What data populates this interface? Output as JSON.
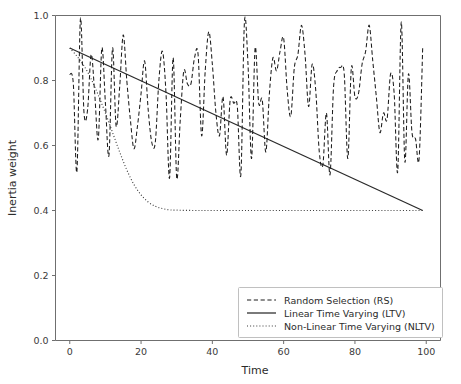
{
  "chart_data": {
    "type": "line",
    "title": "",
    "xlabel": "Time",
    "ylabel": "Inertia weight",
    "xlim": [
      -4,
      104
    ],
    "ylim": [
      0.0,
      1.0
    ],
    "xticks": [
      0,
      20,
      40,
      60,
      80,
      100
    ],
    "xtick_labels": [
      "0",
      "20",
      "40",
      "60",
      "80",
      "100"
    ],
    "yticks": [
      0.0,
      0.2,
      0.4,
      0.6,
      0.8,
      1.0
    ],
    "ytick_labels": [
      "0.0",
      "0.2",
      "0.4",
      "0.6",
      "0.8",
      "1.0"
    ],
    "grid": false,
    "legend_position": "lower right",
    "series": [
      {
        "name": "Random Selection (RS)",
        "style": "dashed",
        "color": "#1c1c1c",
        "x": [
          0,
          1,
          2,
          3,
          4,
          5,
          6,
          7,
          8,
          9,
          10,
          11,
          12,
          13,
          14,
          15,
          16,
          17,
          18,
          19,
          20,
          21,
          22,
          23,
          24,
          25,
          26,
          27,
          28,
          29,
          30,
          31,
          32,
          33,
          34,
          35,
          36,
          37,
          38,
          39,
          40,
          41,
          42,
          43,
          44,
          45,
          46,
          47,
          48,
          49,
          50,
          51,
          52,
          53,
          54,
          55,
          56,
          57,
          58,
          59,
          60,
          61,
          62,
          63,
          64,
          65,
          66,
          67,
          68,
          69,
          70,
          71,
          72,
          73,
          74,
          75,
          76,
          77,
          78,
          79,
          80,
          81,
          82,
          83,
          84,
          85,
          86,
          87,
          88,
          89,
          90,
          91,
          92,
          93,
          94,
          95,
          96,
          97,
          98,
          99
        ],
        "values": [
          0.82,
          0.79,
          0.52,
          0.99,
          0.7,
          0.71,
          0.88,
          0.76,
          0.62,
          0.9,
          0.73,
          0.57,
          0.9,
          0.66,
          0.78,
          0.94,
          0.8,
          0.68,
          0.59,
          0.66,
          0.76,
          0.86,
          0.71,
          0.61,
          0.61,
          0.8,
          0.89,
          0.76,
          0.5,
          0.87,
          0.5,
          0.68,
          0.83,
          0.79,
          0.79,
          0.87,
          0.88,
          0.63,
          0.83,
          0.95,
          0.85,
          0.7,
          0.63,
          0.75,
          0.57,
          0.74,
          0.73,
          0.72,
          0.51,
          0.98,
          0.85,
          0.56,
          0.9,
          0.73,
          0.74,
          0.58,
          0.76,
          0.87,
          0.83,
          0.89,
          0.93,
          0.77,
          0.69,
          0.84,
          0.88,
          0.97,
          0.88,
          0.72,
          0.85,
          0.77,
          0.58,
          0.54,
          0.7,
          0.51,
          0.78,
          0.83,
          0.84,
          0.82,
          0.56,
          0.84,
          0.75,
          0.76,
          0.85,
          0.89,
          0.97,
          0.86,
          0.75,
          0.64,
          0.7,
          0.68,
          0.82,
          0.76,
          0.52,
          0.98,
          0.55,
          0.82,
          0.64,
          0.62,
          0.56,
          0.9
        ]
      },
      {
        "name": "Linear Time Varying (LTV)",
        "style": "solid",
        "color": "#2a2a2a",
        "x": [
          0,
          99
        ],
        "values": [
          0.9,
          0.4
        ]
      },
      {
        "name": "Non-Linear Time Varying (NLTV)",
        "style": "dotted",
        "color": "#3a3a3a",
        "x": [
          0,
          2,
          4,
          6,
          8,
          10,
          12,
          14,
          16,
          18,
          20,
          22,
          24,
          26,
          28,
          30,
          35,
          40,
          50,
          60,
          70,
          80,
          90,
          99
        ],
        "values": [
          0.9,
          0.875,
          0.845,
          0.805,
          0.755,
          0.7,
          0.64,
          0.58,
          0.525,
          0.48,
          0.448,
          0.426,
          0.413,
          0.406,
          0.402,
          0.401,
          0.4,
          0.4,
          0.4,
          0.4,
          0.4,
          0.4,
          0.4,
          0.4
        ]
      }
    ]
  },
  "legend": {
    "entries": [
      {
        "label": "Random Selection (RS)",
        "style": "dashed"
      },
      {
        "label": "Linear Time Varying (LTV)",
        "style": "solid"
      },
      {
        "label": "Non-Linear Time Varying (NLTV)",
        "style": "dotted"
      }
    ]
  }
}
